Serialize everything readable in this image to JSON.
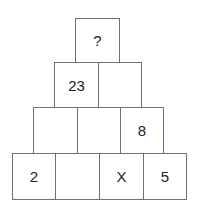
{
  "puzzle": {
    "type": "number-pyramid",
    "rows": [
      {
        "cells": [
          "?"
        ]
      },
      {
        "cells": [
          "23",
          ""
        ]
      },
      {
        "cells": [
          "",
          "",
          "8"
        ]
      },
      {
        "cells": [
          "2",
          "",
          "X",
          "5"
        ]
      }
    ]
  }
}
